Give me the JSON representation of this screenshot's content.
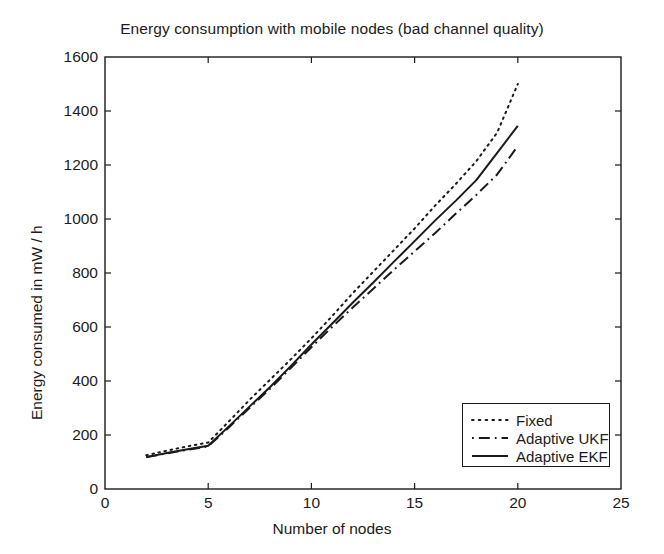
{
  "chart_data": {
    "type": "line",
    "title": "Energy consumption with mobile nodes (bad channel quality)",
    "xlabel": "Number of nodes",
    "ylabel": "Energy consumed in mW / h",
    "xlim": [
      0,
      25
    ],
    "ylim": [
      0,
      1600
    ],
    "xticks": [
      0,
      5,
      10,
      15,
      20,
      25
    ],
    "yticks": [
      0,
      200,
      400,
      600,
      800,
      1000,
      1200,
      1400,
      1600
    ],
    "grid": false,
    "legend_position": "lower right",
    "x": [
      2,
      3,
      4,
      5,
      6,
      7,
      8,
      9,
      10,
      11,
      12,
      13,
      14,
      15,
      16,
      17,
      18,
      19,
      20
    ],
    "series": [
      {
        "name": "Fixed",
        "style": "dotted",
        "color": "#1a1a1a",
        "values": [
          125,
          142,
          158,
          172,
          250,
          330,
          405,
          480,
          558,
          640,
          725,
          805,
          885,
          965,
          1050,
          1130,
          1215,
          1320,
          1500
        ]
      },
      {
        "name": "Adaptive UKF",
        "style": "dash-dot",
        "color": "#1a1a1a",
        "values": [
          118,
          132,
          145,
          158,
          228,
          300,
          372,
          448,
          525,
          600,
          672,
          742,
          812,
          880,
          948,
          1020,
          1090,
          1165,
          1270
        ]
      },
      {
        "name": "Adaptive EKF",
        "style": "solid",
        "color": "#1a1a1a",
        "values": [
          118,
          133,
          147,
          160,
          232,
          305,
          378,
          455,
          535,
          612,
          690,
          765,
          842,
          918,
          995,
          1068,
          1145,
          1245,
          1345
        ]
      }
    ]
  },
  "legend": {
    "entries": [
      {
        "label": "Fixed",
        "style": "dotted"
      },
      {
        "label": "Adaptive UKF",
        "style": "dash-dot"
      },
      {
        "label": "Adaptive EKF",
        "style": "solid"
      }
    ]
  },
  "colors": {
    "ink": "#1a1a1a",
    "background": "#ffffff"
  }
}
